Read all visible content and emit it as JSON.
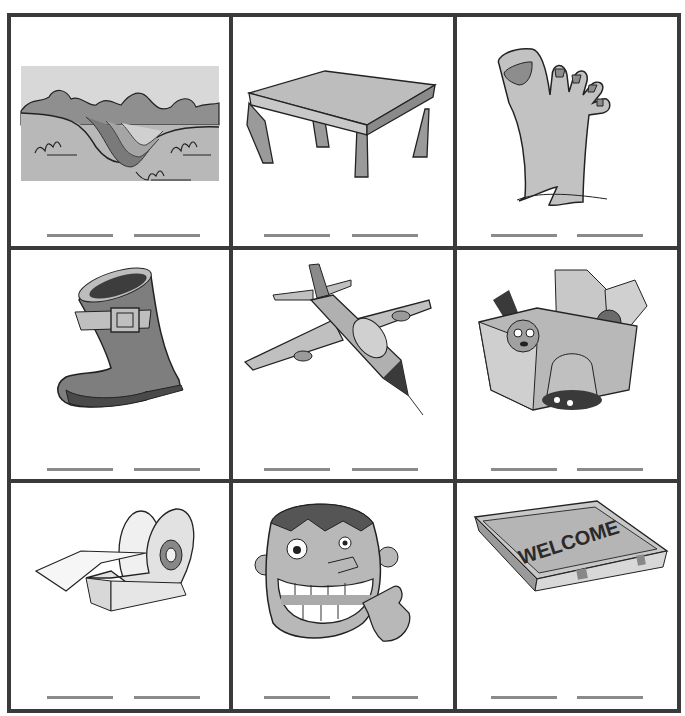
{
  "worksheet": {
    "type": "picture word-writing grid",
    "rows": 3,
    "columns": 3,
    "colors": {
      "border": "#3a3a3a",
      "blank_line": "#8a8a8a",
      "fill_light": "#c8c8c8",
      "fill_mid": "#9a9a9a",
      "fill_dark": "#5a5a5a",
      "outline": "#222222"
    },
    "cells": [
      {
        "picture": "valley",
        "blanks": 2
      },
      {
        "picture": "table",
        "blanks": 2
      },
      {
        "picture": "foot",
        "blanks": 2
      },
      {
        "picture": "boot",
        "blanks": 2
      },
      {
        "picture": "jet-plane",
        "blanks": 2
      },
      {
        "picture": "toy-box",
        "blanks": 2
      },
      {
        "picture": "tape-dispenser",
        "blanks": 2
      },
      {
        "picture": "teeth-smile",
        "blanks": 2
      },
      {
        "picture": "welcome-mat",
        "blanks": 2,
        "mat_text": "WELCOME"
      }
    ]
  }
}
